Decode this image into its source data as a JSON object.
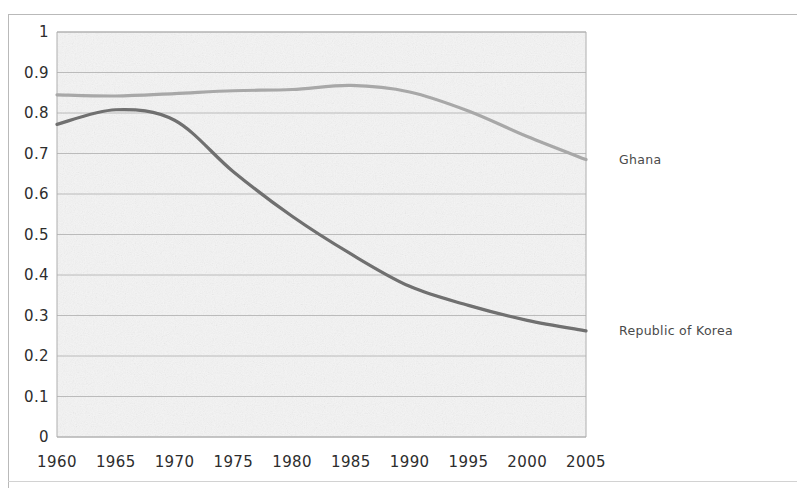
{
  "figure": {
    "background_color": "#ffffff",
    "plot_background_color": "#f4f4f4",
    "plot_border_color": "#aeaeae",
    "gridline_color": "#b4b4b4",
    "axis_text_color": "#2d2d2d",
    "label_text_color": "#4a4a4a"
  },
  "plot_geometry": {
    "left": 57,
    "right": 586,
    "top": 32,
    "bottom": 437
  },
  "labels": {
    "ghana": "Ghana",
    "korea": "Republic of Korea"
  },
  "chart_data": {
    "type": "line",
    "title": "",
    "subtitle": "",
    "xlabel": "",
    "ylabel": "",
    "xlim": [
      1960,
      2005
    ],
    "ylim": [
      0,
      1
    ],
    "grid": true,
    "grid_axis": "y",
    "legend_position": "inline-right-of-line-ends",
    "x_tick_labels": [
      "1960",
      "1965",
      "1970",
      "1975",
      "1980",
      "1985",
      "1990",
      "1995",
      "2000",
      "2005"
    ],
    "x_ticks": [
      1960,
      1965,
      1970,
      1975,
      1980,
      1985,
      1990,
      1995,
      2000,
      2005
    ],
    "y_tick_labels": [
      "0",
      "0.1",
      "0.2",
      "0.3",
      "0.4",
      "0.5",
      "0.6",
      "0.7",
      "0.8",
      "0.9",
      "1"
    ],
    "y_ticks": [
      0,
      0.1,
      0.2,
      0.3,
      0.4,
      0.5,
      0.6,
      0.7,
      0.8,
      0.9,
      1
    ],
    "x": [
      1960,
      1965,
      1970,
      1975,
      1980,
      1985,
      1990,
      1995,
      2000,
      2005
    ],
    "series": [
      {
        "name": "Ghana",
        "color": "#a8a8a8",
        "line_width": 3.2,
        "values": [
          0.845,
          0.842,
          0.848,
          0.855,
          0.858,
          0.868,
          0.852,
          0.805,
          0.742,
          0.685
        ]
      },
      {
        "name": "Republic of Korea",
        "color": "#6f6f6f",
        "line_width": 3.2,
        "values": [
          0.772,
          0.808,
          0.782,
          0.655,
          0.545,
          0.452,
          0.372,
          0.325,
          0.288,
          0.262
        ]
      }
    ],
    "annotations": [
      {
        "text": "Ghana",
        "series": "Ghana",
        "at_x": 2005,
        "placement": "right-of-end"
      },
      {
        "text": "Republic of Korea",
        "series": "Republic of Korea",
        "at_x": 2005,
        "placement": "right-of-end"
      }
    ]
  }
}
